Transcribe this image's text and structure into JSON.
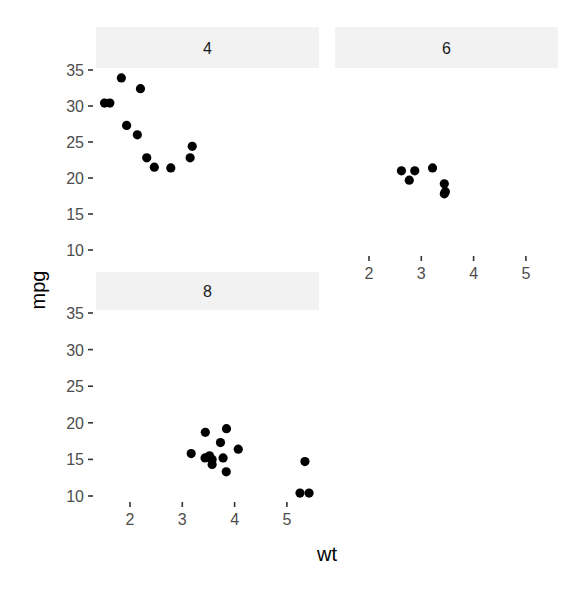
{
  "chart_data": {
    "type": "scatter",
    "facet_by": "cyl",
    "xlabel": "wt",
    "ylabel": "mpg",
    "xlim": [
      1.4,
      5.6
    ],
    "ylim": [
      9,
      35.5
    ],
    "x_ticks": [
      2,
      3,
      4,
      5
    ],
    "y_ticks": [
      10,
      15,
      20,
      25,
      30,
      35
    ],
    "grid": false,
    "legend": "none",
    "point_color": "#000000",
    "strip_color": "#f2f2f2",
    "panels": [
      {
        "label": "4",
        "points": [
          {
            "x": 2.32,
            "y": 22.8
          },
          {
            "x": 3.19,
            "y": 24.4
          },
          {
            "x": 3.15,
            "y": 22.8
          },
          {
            "x": 2.2,
            "y": 32.4
          },
          {
            "x": 1.615,
            "y": 30.4
          },
          {
            "x": 1.835,
            "y": 33.9
          },
          {
            "x": 2.465,
            "y": 21.5
          },
          {
            "x": 1.935,
            "y": 27.3
          },
          {
            "x": 2.14,
            "y": 26.0
          },
          {
            "x": 1.513,
            "y": 30.4
          },
          {
            "x": 2.78,
            "y": 21.4
          }
        ]
      },
      {
        "label": "6",
        "points": [
          {
            "x": 2.62,
            "y": 21.0
          },
          {
            "x": 2.875,
            "y": 21.0
          },
          {
            "x": 3.215,
            "y": 21.4
          },
          {
            "x": 3.46,
            "y": 18.1
          },
          {
            "x": 3.44,
            "y": 19.2
          },
          {
            "x": 3.44,
            "y": 17.8
          },
          {
            "x": 2.77,
            "y": 19.7
          }
        ]
      },
      {
        "label": "8",
        "points": [
          {
            "x": 3.44,
            "y": 18.7
          },
          {
            "x": 3.57,
            "y": 14.3
          },
          {
            "x": 4.07,
            "y": 16.4
          },
          {
            "x": 3.73,
            "y": 17.3
          },
          {
            "x": 3.78,
            "y": 15.2
          },
          {
            "x": 5.25,
            "y": 10.4
          },
          {
            "x": 5.424,
            "y": 10.4
          },
          {
            "x": 5.345,
            "y": 14.7
          },
          {
            "x": 3.52,
            "y": 15.5
          },
          {
            "x": 3.435,
            "y": 15.2
          },
          {
            "x": 3.84,
            "y": 13.3
          },
          {
            "x": 3.845,
            "y": 19.2
          },
          {
            "x": 3.17,
            "y": 15.8
          },
          {
            "x": 3.57,
            "y": 15.0
          }
        ]
      }
    ]
  },
  "labels": {
    "xlabel": "wt",
    "ylabel": "mpg",
    "panel_4": "4",
    "panel_6": "6",
    "panel_8": "8"
  }
}
